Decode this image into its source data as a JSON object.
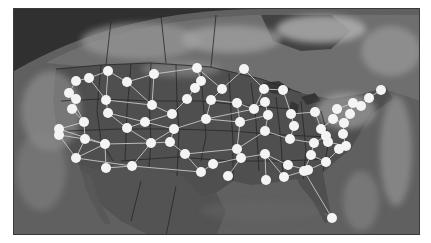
{
  "map": {
    "title": "US network over satellite imagery",
    "style": "grayscale",
    "colors": {
      "space": "#2b2b2b",
      "ocean": "#5a5a5a",
      "land": "#4a4a4a",
      "clouds_light": "#bdbdbd",
      "clouds_mid": "#8f8f8f",
      "node": "#ffffff",
      "edge": "#d8d8d8",
      "border": "#1e1e1e"
    }
  },
  "network": {
    "nodes": [
      {
        "id": 0,
        "x": 75,
        "y": 80
      },
      {
        "id": 1,
        "x": 88,
        "y": 77
      },
      {
        "id": 2,
        "x": 107,
        "y": 70
      },
      {
        "id": 3,
        "x": 126,
        "y": 81
      },
      {
        "id": 4,
        "x": 153,
        "y": 73
      },
      {
        "id": 5,
        "x": 196,
        "y": 67
      },
      {
        "id": 6,
        "x": 68,
        "y": 92
      },
      {
        "id": 7,
        "x": 75,
        "y": 98
      },
      {
        "id": 8,
        "x": 71,
        "y": 108
      },
      {
        "id": 9,
        "x": 105,
        "y": 99
      },
      {
        "id": 10,
        "x": 83,
        "y": 121
      },
      {
        "id": 11,
        "x": 58,
        "y": 128
      },
      {
        "id": 12,
        "x": 58,
        "y": 134
      },
      {
        "id": 13,
        "x": 84,
        "y": 138
      },
      {
        "id": 14,
        "x": 107,
        "y": 112
      },
      {
        "id": 15,
        "x": 151,
        "y": 104
      },
      {
        "id": 16,
        "x": 126,
        "y": 127
      },
      {
        "id": 17,
        "x": 144,
        "y": 121
      },
      {
        "id": 18,
        "x": 171,
        "y": 113
      },
      {
        "id": 19,
        "x": 194,
        "y": 87
      },
      {
        "id": 20,
        "x": 200,
        "y": 80
      },
      {
        "id": 21,
        "x": 221,
        "y": 88
      },
      {
        "id": 22,
        "x": 243,
        "y": 68
      },
      {
        "id": 23,
        "x": 186,
        "y": 98
      },
      {
        "id": 24,
        "x": 75,
        "y": 157
      },
      {
        "id": 25,
        "x": 104,
        "y": 143
      },
      {
        "id": 26,
        "x": 105,
        "y": 167
      },
      {
        "id": 27,
        "x": 131,
        "y": 165
      },
      {
        "id": 28,
        "x": 150,
        "y": 142
      },
      {
        "id": 29,
        "x": 169,
        "y": 141
      },
      {
        "id": 30,
        "x": 184,
        "y": 153
      },
      {
        "id": 31,
        "x": 200,
        "y": 171
      },
      {
        "id": 32,
        "x": 212,
        "y": 163
      },
      {
        "id": 33,
        "x": 173,
        "y": 128
      },
      {
        "id": 34,
        "x": 205,
        "y": 118
      },
      {
        "id": 35,
        "x": 210,
        "y": 99
      },
      {
        "id": 36,
        "x": 236,
        "y": 102
      },
      {
        "id": 37,
        "x": 239,
        "y": 121
      },
      {
        "id": 38,
        "x": 253,
        "y": 108
      },
      {
        "id": 39,
        "x": 263,
        "y": 88
      },
      {
        "id": 40,
        "x": 282,
        "y": 89
      },
      {
        "id": 41,
        "x": 264,
        "y": 101
      },
      {
        "id": 42,
        "x": 267,
        "y": 114
      },
      {
        "id": 43,
        "x": 236,
        "y": 148
      },
      {
        "id": 44,
        "x": 240,
        "y": 157
      },
      {
        "id": 45,
        "x": 227,
        "y": 175
      },
      {
        "id": 46,
        "x": 264,
        "y": 130
      },
      {
        "id": 47,
        "x": 264,
        "y": 153
      },
      {
        "id": 48,
        "x": 265,
        "y": 179
      },
      {
        "id": 49,
        "x": 289,
        "y": 138
      },
      {
        "id": 50,
        "x": 290,
        "y": 113
      },
      {
        "id": 51,
        "x": 293,
        "y": 125
      },
      {
        "id": 52,
        "x": 283,
        "y": 176
      },
      {
        "id": 53,
        "x": 303,
        "y": 170
      },
      {
        "id": 54,
        "x": 310,
        "y": 154
      },
      {
        "id": 55,
        "x": 313,
        "y": 142
      },
      {
        "id": 56,
        "x": 325,
        "y": 135
      },
      {
        "id": 57,
        "x": 314,
        "y": 111
      },
      {
        "id": 58,
        "x": 320,
        "y": 128
      },
      {
        "id": 59,
        "x": 332,
        "y": 118
      },
      {
        "id": 60,
        "x": 336,
        "y": 108
      },
      {
        "id": 61,
        "x": 343,
        "y": 122
      },
      {
        "id": 62,
        "x": 352,
        "y": 102
      },
      {
        "id": 63,
        "x": 360,
        "y": 105
      },
      {
        "id": 64,
        "x": 368,
        "y": 97
      },
      {
        "id": 65,
        "x": 380,
        "y": 89
      },
      {
        "id": 66,
        "x": 342,
        "y": 133
      },
      {
        "id": 67,
        "x": 345,
        "y": 145
      },
      {
        "id": 68,
        "x": 325,
        "y": 161
      },
      {
        "id": 69,
        "x": 307,
        "y": 169
      },
      {
        "id": 70,
        "x": 287,
        "y": 164
      },
      {
        "id": 71,
        "x": 331,
        "y": 217
      },
      {
        "id": 72,
        "x": 338,
        "y": 148
      },
      {
        "id": 73,
        "x": 349,
        "y": 113
      },
      {
        "id": 74,
        "x": 327,
        "y": 141
      }
    ],
    "edges": [
      [
        0,
        1
      ],
      [
        1,
        2
      ],
      [
        2,
        3
      ],
      [
        3,
        4
      ],
      [
        4,
        5
      ],
      [
        0,
        6
      ],
      [
        6,
        7
      ],
      [
        7,
        8
      ],
      [
        1,
        9
      ],
      [
        2,
        9
      ],
      [
        3,
        15
      ],
      [
        4,
        15
      ],
      [
        9,
        14
      ],
      [
        8,
        10
      ],
      [
        10,
        11
      ],
      [
        11,
        12
      ],
      [
        10,
        13
      ],
      [
        12,
        13
      ],
      [
        13,
        25
      ],
      [
        14,
        16
      ],
      [
        16,
        17
      ],
      [
        17,
        18
      ],
      [
        18,
        23
      ],
      [
        23,
        19
      ],
      [
        19,
        20
      ],
      [
        20,
        5
      ],
      [
        5,
        21
      ],
      [
        21,
        22
      ],
      [
        22,
        39
      ],
      [
        15,
        18
      ],
      [
        14,
        17
      ],
      [
        13,
        24
      ],
      [
        24,
        25
      ],
      [
        25,
        26
      ],
      [
        26,
        27
      ],
      [
        27,
        28
      ],
      [
        28,
        29
      ],
      [
        29,
        30
      ],
      [
        30,
        31
      ],
      [
        31,
        32
      ],
      [
        16,
        28
      ],
      [
        17,
        33
      ],
      [
        33,
        29
      ],
      [
        33,
        34
      ],
      [
        34,
        35
      ],
      [
        35,
        21
      ],
      [
        34,
        37
      ],
      [
        36,
        37
      ],
      [
        35,
        36
      ],
      [
        36,
        38
      ],
      [
        38,
        39
      ],
      [
        39,
        40
      ],
      [
        38,
        41
      ],
      [
        41,
        42
      ],
      [
        42,
        37
      ],
      [
        37,
        43
      ],
      [
        43,
        44
      ],
      [
        44,
        45
      ],
      [
        44,
        47
      ],
      [
        47,
        48
      ],
      [
        43,
        46
      ],
      [
        46,
        49
      ],
      [
        49,
        51
      ],
      [
        51,
        50
      ],
      [
        50,
        40
      ],
      [
        46,
        42
      ],
      [
        47,
        52
      ],
      [
        52,
        53
      ],
      [
        53,
        54
      ],
      [
        54,
        55
      ],
      [
        55,
        49
      ],
      [
        55,
        56
      ],
      [
        56,
        58
      ],
      [
        58,
        57
      ],
      [
        57,
        50
      ],
      [
        58,
        59
      ],
      [
        59,
        60
      ],
      [
        60,
        62
      ],
      [
        62,
        63
      ],
      [
        63,
        64
      ],
      [
        64,
        65
      ],
      [
        59,
        61
      ],
      [
        61,
        66
      ],
      [
        66,
        67
      ],
      [
        67,
        72
      ],
      [
        72,
        68
      ],
      [
        68,
        69
      ],
      [
        69,
        70
      ],
      [
        70,
        47
      ],
      [
        54,
        68
      ],
      [
        53,
        71
      ],
      [
        12,
        24
      ],
      [
        11,
        25
      ],
      [
        6,
        10
      ],
      [
        25,
        28
      ],
      [
        27,
        31
      ],
      [
        32,
        44
      ],
      [
        30,
        43
      ],
      [
        24,
        27
      ],
      [
        73,
        62
      ],
      [
        73,
        61
      ],
      [
        74,
        56
      ],
      [
        74,
        67
      ],
      [
        9,
        15
      ],
      [
        28,
        33
      ],
      [
        34,
        38
      ]
    ]
  }
}
